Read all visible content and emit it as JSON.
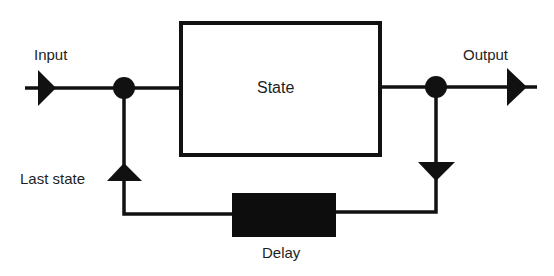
{
  "diagram": {
    "type": "block-diagram",
    "nodes": {
      "input": {
        "label": "Input"
      },
      "state": {
        "label": "State"
      },
      "output": {
        "label": "Output"
      },
      "delay": {
        "label": "Delay"
      },
      "last_state": {
        "label": "Last state"
      }
    },
    "edges": [
      {
        "from": "input",
        "to": "state"
      },
      {
        "from": "state",
        "to": "output"
      },
      {
        "from": "output-junction",
        "to": "delay"
      },
      {
        "from": "delay",
        "to": "input-junction",
        "label": "Last state"
      }
    ],
    "colors": {
      "stroke": "#111111",
      "delay_fill": "#0d0d0d",
      "background": "#ffffff"
    }
  }
}
